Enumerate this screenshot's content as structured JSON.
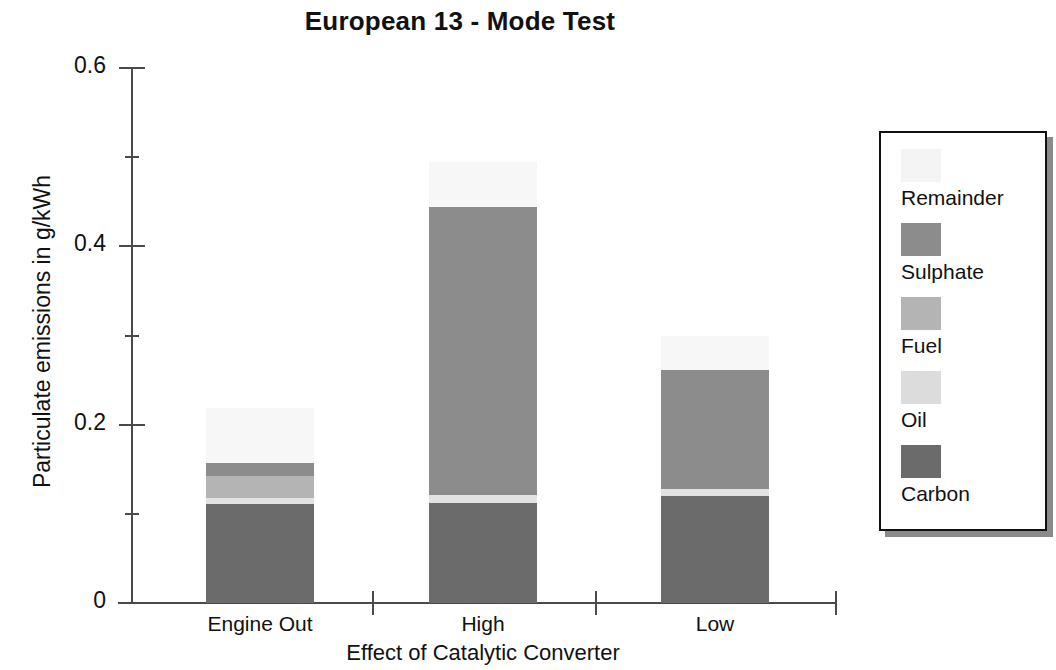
{
  "chart_data": {
    "type": "bar",
    "subtype": "stacked",
    "title": "European 13 - Mode Test",
    "xlabel": "Effect of Catalytic Converter",
    "ylabel": "Particulate emissions in g/kWh",
    "categories": [
      "Engine Out",
      "High",
      "Low"
    ],
    "ylim": [
      0,
      0.6
    ],
    "yticks": [
      0,
      0.2,
      0.4,
      0.6
    ],
    "ytick_labels": [
      "0",
      "0.2",
      "0.4",
      "0.6"
    ],
    "yminor_ticks": [
      0.1,
      0.3,
      0.5
    ],
    "grid": false,
    "legend_position": "right",
    "stack_order_bottom_to_top": [
      "Carbon",
      "Oil",
      "Fuel",
      "Sulphate",
      "Remainder"
    ],
    "series": [
      {
        "name": "Carbon",
        "color": "#6b6b6b",
        "values": [
          0.111,
          0.112,
          0.12
        ]
      },
      {
        "name": "Oil",
        "color": "#e2e2e2",
        "values": [
          0.007,
          0.009,
          0.008
        ]
      },
      {
        "name": "Fuel",
        "color": "#b4b4b4",
        "values": [
          0.024,
          0.0,
          0.0
        ]
      },
      {
        "name": "Sulphate",
        "color": "#8c8c8c",
        "values": [
          0.015,
          0.323,
          0.133
        ]
      },
      {
        "name": "Remainder",
        "color": "#f7f7f7",
        "values": [
          0.062,
          0.051,
          0.039
        ]
      }
    ],
    "totals": [
      0.219,
      0.495,
      0.3
    ],
    "legend_entries": [
      {
        "label": "Remainder",
        "color": "#f4f4f4"
      },
      {
        "label": "Sulphate",
        "color": "#8c8c8c"
      },
      {
        "label": "Fuel",
        "color": "#b4b4b4"
      },
      {
        "label": "Oil",
        "color": "#dcdcdc"
      },
      {
        "label": "Carbon",
        "color": "#6b6b6b"
      }
    ],
    "axis_color": "#4a4a4a",
    "text_color": "#111111",
    "background": "#ffffff"
  }
}
